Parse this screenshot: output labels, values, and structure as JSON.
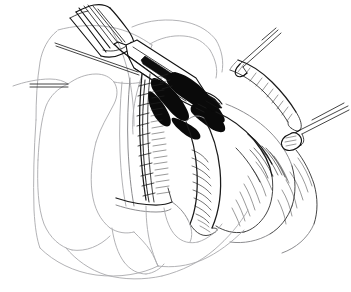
{
  "illustration": {
    "title": "Surgical operative field line illustration",
    "medium": "pen-and-ink line art",
    "background_color": "#ffffff",
    "ink_color": "#111111",
    "faint_line_color": "#9a9a9e",
    "canvas": {
      "width": 351,
      "height": 292
    },
    "caption": "",
    "labels": [],
    "regions": [
      {
        "name": "fan-retractor-blade",
        "description": "Folded fan-shaped retractor blade, upper left, drawn as parallel diagonal strokes",
        "position": "upper-left"
      },
      {
        "name": "clamp-instrument",
        "description": "Long straight clamp shaft with elongated dark slot crossing the field diagonally",
        "position": "upper-center"
      },
      {
        "name": "left-organ-mass",
        "description": "Large smooth organ lobe rendered in faint contour outline only",
        "position": "left"
      },
      {
        "name": "sutured-incision-line",
        "description": "Vertical closure line with evenly spaced cross stitches",
        "position": "center-left"
      },
      {
        "name": "central-shadow-cavity",
        "description": "Dense black shaded cavity at the surgical site",
        "position": "center"
      },
      {
        "name": "right-tissue-flap",
        "description": "Curved tissue flap with dense parallel hatch shading",
        "position": "right-center"
      },
      {
        "name": "upper-right-forceps",
        "description": "Fine forceps shaft entering from the upper right",
        "position": "upper-right"
      },
      {
        "name": "right-forceps",
        "description": "Forceps tip grasping tissue, entering from the right edge",
        "position": "right"
      },
      {
        "name": "lower-organ-contour",
        "description": "Smooth lower organ border sweeping across the bottom",
        "position": "bottom"
      }
    ]
  }
}
